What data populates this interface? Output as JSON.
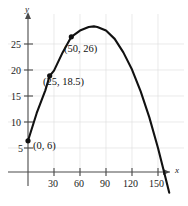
{
  "chart_data": {
    "type": "line",
    "title": "",
    "subtitle": "",
    "xlabel": "x",
    "ylabel": "y",
    "grid": true,
    "legend": null,
    "xlim": [
      -8,
      172
    ],
    "ylim": [
      -3,
      31
    ],
    "xticks": [
      30,
      60,
      90,
      120,
      150
    ],
    "yticks": [
      5,
      10,
      15,
      20,
      25
    ],
    "xtick_labels": [
      "30",
      "60",
      "90",
      "120",
      "150"
    ],
    "ytick_labels": [
      "5",
      "10",
      "15",
      "20",
      "25"
    ],
    "series": [
      {
        "name": "parabola",
        "curve": "downward parabola through (0,6), (25,18.5), (50,26)",
        "x": [
          0,
          10,
          20,
          25,
          30,
          40,
          50,
          60,
          70,
          76,
          80,
          90,
          100,
          110,
          120,
          130,
          140,
          150,
          157,
          163
        ],
        "y": [
          6,
          11.3,
          15.7,
          18.5,
          19.5,
          23.0,
          26.0,
          27.2,
          27.9,
          28.0,
          27.9,
          27.2,
          25.6,
          23.0,
          19.7,
          15.5,
          10.5,
          4.6,
          0.0,
          -4.0
        ]
      }
    ],
    "points": [
      {
        "label": "(0, 6)",
        "x": 0,
        "y": 6
      },
      {
        "label": "(25, 18.5)",
        "x": 25,
        "y": 18.5
      },
      {
        "label": "(50, 26)",
        "x": 50,
        "y": 26
      }
    ],
    "colors": {
      "curve": "#111111",
      "axis": "#4a4a4a",
      "grid": "#d8d8d8",
      "marker": "#111111",
      "text": "#1a1a1a",
      "background": "#ffffff"
    }
  },
  "axes": {
    "x_axis_label": "x",
    "y_axis_label": "y"
  }
}
